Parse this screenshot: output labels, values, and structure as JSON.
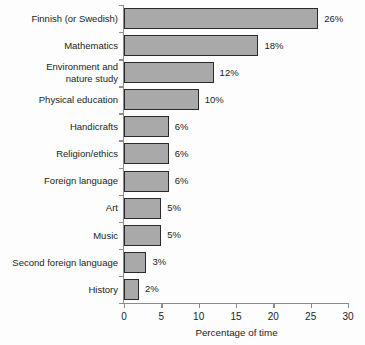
{
  "chart_data": {
    "type": "bar",
    "orientation": "horizontal",
    "title": "",
    "xlabel": "Percentage of time",
    "ylabel": "",
    "xlim": [
      0,
      30
    ],
    "xticks": [
      0,
      5,
      10,
      15,
      20,
      25,
      30
    ],
    "xtick_labels": [
      "0",
      "5",
      "10",
      "15",
      "20",
      "25",
      "30"
    ],
    "grid": false,
    "legend": false,
    "categories": [
      "Finnish (or Swedish)",
      "Mathematics",
      "Environment and\nnature study",
      "Physical education",
      "Handicrafts",
      "Religion/ethics",
      "Foreign language",
      "Art",
      "Music",
      "Second foreign language",
      "History"
    ],
    "values": [
      26,
      18,
      12,
      10,
      6,
      6,
      6,
      5,
      5,
      3,
      2
    ],
    "value_labels": [
      "26%",
      "18%",
      "12%",
      "10%",
      "6%",
      "6%",
      "6%",
      "5%",
      "5%",
      "3%",
      "2%"
    ],
    "colors": {
      "bar_fill": "#a9a9a9",
      "bar_border": "#2a2a2a",
      "axis": "#8c8c8c",
      "text": "#1c1c1c",
      "background": "#fdfdfd"
    }
  }
}
